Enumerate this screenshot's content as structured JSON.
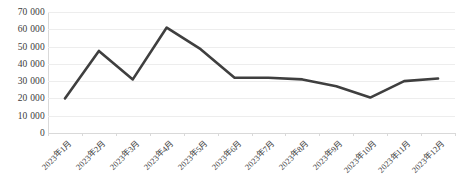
{
  "chart_data": {
    "type": "line",
    "title": "",
    "xlabel": "",
    "ylabel": "",
    "categories": [
      "2023年1月",
      "2023年2月",
      "2023年3月",
      "2023年4月",
      "2023年5月",
      "2023年6月",
      "2023年7月",
      "2023年8月",
      "2023年9月",
      "2023年10月",
      "2023年11月",
      "2023年12月"
    ],
    "values": [
      20000,
      47500,
      31000,
      61000,
      48500,
      32000,
      32000,
      31000,
      27000,
      20500,
      30000,
      31500
    ],
    "ylim": [
      0,
      70000
    ],
    "ytick_values": [
      0,
      10000,
      20000,
      30000,
      40000,
      50000,
      60000,
      70000
    ],
    "ytick_labels": [
      "0",
      "10 000",
      "20 000",
      "30 000",
      "40 000",
      "50 000",
      "60 000",
      "70 000"
    ],
    "grid": true,
    "legend": false,
    "series_color": "#3f3f3f",
    "gridline_color": "#ededed",
    "axis_color": "#d9d9d9"
  },
  "caption": {
    "text": ""
  }
}
